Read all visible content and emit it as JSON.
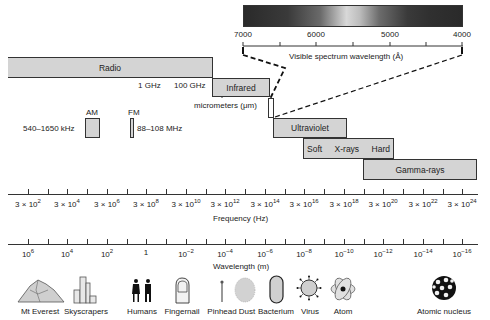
{
  "visible_spectrum": {
    "title": "Visible spectrum wavelength (Å)",
    "ticks": [
      "7000",
      "6000",
      "5000",
      "4000"
    ]
  },
  "bands": {
    "radio": "Radio",
    "infrared": "Infrared",
    "ultraviolet": "Ultraviolet",
    "xray_soft": "Soft",
    "xray_label": "X-rays",
    "xray_hard": "Hard",
    "gamma": "Gamma-rays"
  },
  "radio_marks": {
    "ghz1": "1 GHz",
    "ghz100": "100 GHz",
    "micrometers": "micrometers (μm)"
  },
  "broadcast": {
    "am_label": "AM",
    "am_range": "540–1650 kHz",
    "fm_label": "FM",
    "fm_range": "88–108 MHz"
  },
  "frequency_axis": {
    "title": "Frequency (Hz)",
    "ticks": [
      {
        "base": "3 × 10",
        "exp": "2"
      },
      {
        "base": "3 × 10",
        "exp": "4"
      },
      {
        "base": "3 × 10",
        "exp": "6"
      },
      {
        "base": "3 × 10",
        "exp": "8"
      },
      {
        "base": "3 × 10",
        "exp": "10"
      },
      {
        "base": "3 × 10",
        "exp": "12"
      },
      {
        "base": "3 × 10",
        "exp": "14"
      },
      {
        "base": "3 × 10",
        "exp": "16"
      },
      {
        "base": "3 × 10",
        "exp": "18"
      },
      {
        "base": "3 × 10",
        "exp": "20"
      },
      {
        "base": "3 × 10",
        "exp": "22"
      },
      {
        "base": "3 × 10",
        "exp": "24"
      }
    ]
  },
  "wavelength_axis": {
    "title": "Wavelength (m)",
    "ticks": [
      {
        "base": "10",
        "exp": "6"
      },
      {
        "base": "10",
        "exp": "4"
      },
      {
        "base": "10",
        "exp": "2"
      },
      {
        "base": "1",
        "exp": ""
      },
      {
        "base": "10",
        "exp": "−2"
      },
      {
        "base": "10",
        "exp": "−4"
      },
      {
        "base": "10",
        "exp": "−6"
      },
      {
        "base": "10",
        "exp": "−8"
      },
      {
        "base": "10",
        "exp": "−10"
      },
      {
        "base": "10",
        "exp": "−12"
      },
      {
        "base": "10",
        "exp": "−14"
      },
      {
        "base": "10",
        "exp": "−16"
      }
    ]
  },
  "objects": [
    {
      "label": "Mt Everest",
      "icon": "mountain-icon"
    },
    {
      "label": "Skyscrapers",
      "icon": "skyscraper-icon"
    },
    {
      "label": "Humans",
      "icon": "humans-icon"
    },
    {
      "label": "Fingernail",
      "icon": "fingernail-icon"
    },
    {
      "label": "Pinhead",
      "icon": "pinhead-icon"
    },
    {
      "label": "Dust",
      "icon": "dust-icon"
    },
    {
      "label": "Bacterium",
      "icon": "bacterium-icon"
    },
    {
      "label": "Virus",
      "icon": "virus-icon"
    },
    {
      "label": "Atom",
      "icon": "atom-icon"
    },
    {
      "label": "Atomic nucleus",
      "icon": "nucleus-icon"
    }
  ],
  "colors": {
    "band_fill": "#d4d4d4",
    "line": "#333333"
  }
}
